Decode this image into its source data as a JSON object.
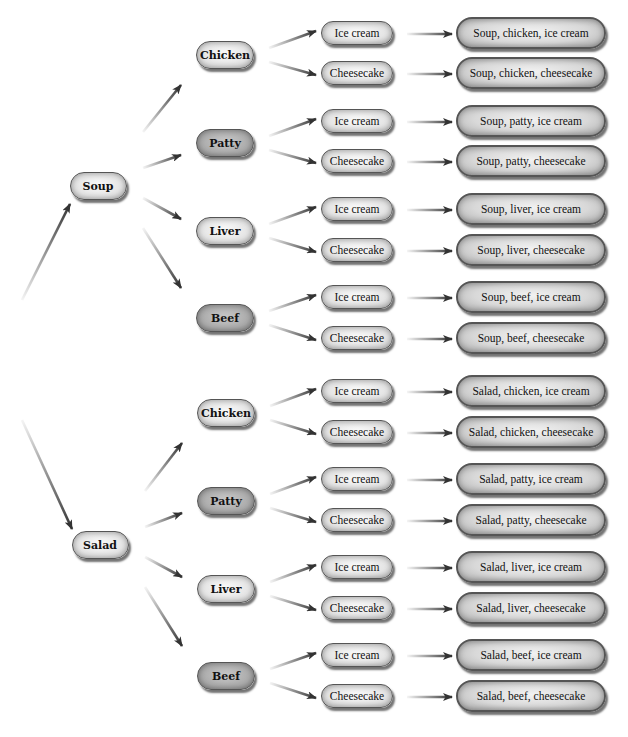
{
  "diagram": {
    "type": "tree",
    "title": "",
    "colors": {
      "arrow": "#333333",
      "light_fill": "#e4e4e4",
      "dark_fill": "#ababab",
      "outline": "#555555"
    },
    "roots": [
      {
        "label": "Soup",
        "x": 98,
        "y": 186,
        "children": [
          {
            "label": "Chicken",
            "x": 225,
            "y": 55,
            "shade": "light",
            "children": [
              {
                "label": "Ice cream",
                "y": 33,
                "outcome": "Soup, chicken, ice cream"
              },
              {
                "label": "Cheesecake",
                "y": 73,
                "outcome": "Soup, chicken, cheesecake"
              }
            ]
          },
          {
            "label": "Patty",
            "x": 225,
            "y": 143,
            "shade": "dark",
            "children": [
              {
                "label": "Ice cream",
                "y": 121,
                "outcome": "Soup, patty, ice cream"
              },
              {
                "label": "Cheesecake",
                "y": 161,
                "outcome": "Soup, patty, cheesecake"
              }
            ]
          },
          {
            "label": "Liver",
            "x": 225,
            "y": 231,
            "shade": "light",
            "children": [
              {
                "label": "Ice cream",
                "y": 209,
                "outcome": "Soup, liver, ice cream"
              },
              {
                "label": "Cheesecake",
                "y": 250,
                "outcome": "Soup, liver, cheesecake"
              }
            ]
          },
          {
            "label": "Beef",
            "x": 225,
            "y": 318,
            "shade": "dark",
            "children": [
              {
                "label": "Ice cream",
                "y": 297,
                "outcome": "Soup, beef, ice cream"
              },
              {
                "label": "Cheesecake",
                "y": 338,
                "outcome": "Soup, beef, cheesecake"
              }
            ]
          }
        ]
      },
      {
        "label": "Salad",
        "x": 100,
        "y": 545,
        "children": [
          {
            "label": "Chicken",
            "x": 226,
            "y": 413,
            "shade": "light",
            "children": [
              {
                "label": "Ice cream",
                "y": 391,
                "outcome": "Salad, chicken, ice cream"
              },
              {
                "label": "Cheesecake",
                "y": 432,
                "outcome": "Salad, chicken, cheesecake"
              }
            ]
          },
          {
            "label": "Patty",
            "x": 226,
            "y": 501,
            "shade": "dark",
            "children": [
              {
                "label": "Ice cream",
                "y": 479,
                "outcome": "Salad, patty, ice cream"
              },
              {
                "label": "Cheesecake",
                "y": 520,
                "outcome": "Salad, patty, cheesecake"
              }
            ]
          },
          {
            "label": "Liver",
            "x": 226,
            "y": 589,
            "shade": "light",
            "children": [
              {
                "label": "Ice cream",
                "y": 567,
                "outcome": "Salad, liver, ice cream"
              },
              {
                "label": "Cheesecake",
                "y": 608,
                "outcome": "Salad, liver, cheesecake"
              }
            ]
          },
          {
            "label": "Beef",
            "x": 226,
            "y": 676,
            "shade": "dark",
            "children": [
              {
                "label": "Ice cream",
                "y": 655,
                "outcome": "Salad, beef, ice cream"
              },
              {
                "label": "Cheesecake",
                "y": 696,
                "outcome": "Salad, beef, cheesecake"
              }
            ]
          }
        ]
      }
    ],
    "start_point": {
      "x": 22,
      "y": 300
    }
  }
}
